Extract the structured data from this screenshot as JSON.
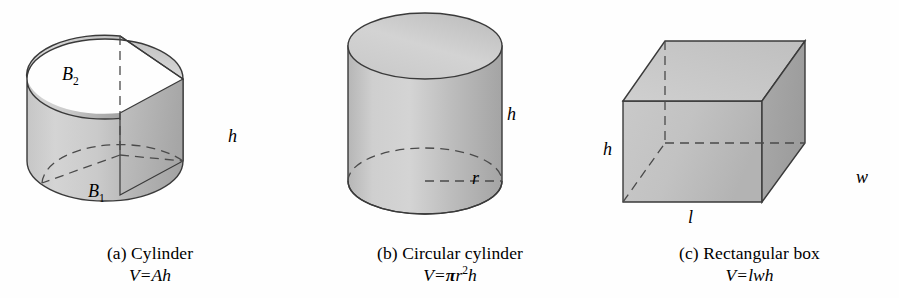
{
  "figure": {
    "background_color": "#fefefe",
    "stroke_color": "#3a3a3a",
    "fill_light": "#cfcfcf",
    "fill_mid": "#c2c2c2",
    "fill_dark": "#a8a8a8",
    "fill_top": "#d2d2d2"
  },
  "panels": [
    {
      "id": "a",
      "caption_title": "(a) Cylinder",
      "formula": {
        "lhs": "V",
        "equals": "=",
        "rhs": "Ah"
      },
      "labels": {
        "top_base": "B",
        "top_base_sub": "2",
        "bottom_base": "B",
        "bottom_base_sub": "1",
        "height": "h"
      }
    },
    {
      "id": "b",
      "caption_title": "(b) Circular cylinder",
      "formula": {
        "lhs": "V",
        "equals": "=",
        "pi": "π",
        "radius": "r",
        "exponent": "2",
        "height_var": "h"
      },
      "labels": {
        "radius": "r",
        "height": "h"
      }
    },
    {
      "id": "c",
      "caption_title": "(c) Rectangular box",
      "formula": {
        "lhs": "V",
        "equals": "=",
        "rhs": "lwh"
      },
      "labels": {
        "height": "h",
        "width": "w",
        "length": "l"
      }
    }
  ]
}
